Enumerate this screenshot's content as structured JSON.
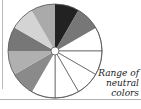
{
  "diagram": {
    "type": "color-wheel",
    "center": [
      55,
      51
    ],
    "radius": 47,
    "segments": [
      {
        "start": 0,
        "end": 30,
        "fill": "#222222"
      },
      {
        "start": 30,
        "end": 60,
        "fill": "#777777"
      },
      {
        "start": 60,
        "end": 90,
        "fill": "#ffffff"
      },
      {
        "start": 90,
        "end": 120,
        "fill": "#ffffff"
      },
      {
        "start": 120,
        "end": 150,
        "fill": "#ffffff"
      },
      {
        "start": 150,
        "end": 180,
        "fill": "#ffffff"
      },
      {
        "start": 180,
        "end": 210,
        "fill": "#ffffff"
      },
      {
        "start": 210,
        "end": 240,
        "fill": "#8a8a8a"
      },
      {
        "start": 240,
        "end": 270,
        "fill": "#b0b0b0"
      },
      {
        "start": 270,
        "end": 300,
        "fill": "#777777"
      },
      {
        "start": 300,
        "end": 330,
        "fill": "#d4d4d4"
      },
      {
        "start": 330,
        "end": 360,
        "fill": "#aaaaaa"
      }
    ],
    "label_lines": [
      "Range of",
      "neutral",
      "colors"
    ]
  }
}
